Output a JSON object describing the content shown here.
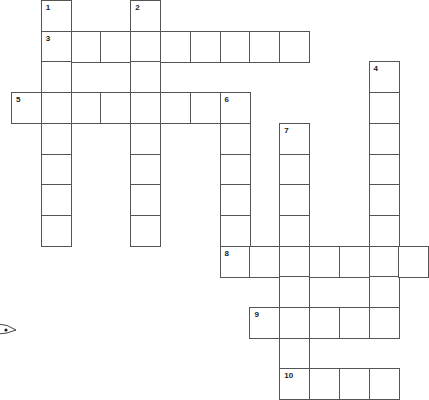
{
  "puzzle": {
    "type": "crossword",
    "cell_size": {
      "w": 29.8,
      "h": 30.7
    },
    "origin": {
      "x": 11,
      "y": 0
    },
    "line_color": "#555555",
    "number_color": "#222222",
    "entries": [
      {
        "number": "1",
        "direction": "down",
        "col": 1,
        "row": 0,
        "length": 8
      },
      {
        "number": "2",
        "direction": "down",
        "col": 4,
        "row": 0,
        "length": 8
      },
      {
        "number": "3",
        "direction": "across",
        "col": 1,
        "row": 1,
        "length": 9
      },
      {
        "number": "4",
        "direction": "down",
        "col": 12,
        "row": 2,
        "length": 9
      },
      {
        "number": "5",
        "direction": "across",
        "col": 0,
        "row": 3,
        "length": 8
      },
      {
        "number": "6",
        "direction": "down",
        "col": 7,
        "row": 3,
        "length": 6
      },
      {
        "number": "7",
        "direction": "down",
        "col": 9,
        "row": 4,
        "length": 9
      },
      {
        "number": "8",
        "direction": "across",
        "col": 7,
        "row": 8,
        "length": 7
      },
      {
        "number": "9",
        "direction": "across",
        "col": 8,
        "row": 10,
        "length": 5
      },
      {
        "number": "10",
        "direction": "across",
        "col": 9,
        "row": 12,
        "length": 4
      }
    ]
  },
  "decoration": {
    "icon": "eye-doodle-icon"
  }
}
